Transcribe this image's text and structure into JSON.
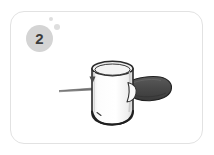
{
  "card": {
    "name": "instruction-step-card",
    "border_color": "#e2e2e2",
    "background_color": "#ffffff"
  },
  "badge": {
    "number": "2",
    "background_color": "#d4d4d4",
    "text_color": "#3d3d3d"
  },
  "bubbles": [
    {
      "name": "bubble-large",
      "color": "#dedede"
    },
    {
      "name": "bubble-small",
      "color": "#dedede"
    }
  ],
  "illustration": {
    "caption": "Cylindrical cup with rod inserted on the left and a dark brush head on the right",
    "cylinder": {
      "name": "cylinder-cup",
      "body_color": "#fafafa",
      "outline_color": "#2b2b2b",
      "rim_color": "#f2f2f2"
    },
    "rod": {
      "name": "thin-rod",
      "color": "#7a7a7a"
    },
    "arrow": {
      "name": "down-arrow-marker",
      "color": "#4a4a4a"
    },
    "brush_head": {
      "name": "dark-brush-head",
      "color": "#4d4d4d",
      "outline_color": "#262626"
    },
    "spout": {
      "name": "spout-flap",
      "color": "#f7f7f7",
      "outline_color": "#3a3a3a"
    }
  }
}
